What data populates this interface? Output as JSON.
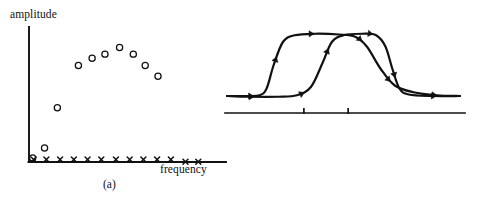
{
  "figure": {
    "width": 483,
    "height": 203,
    "background": "#ffffff",
    "ink_color": "#111111"
  },
  "panel_a": {
    "caption": "(a)",
    "y_axis_label": "amplitude",
    "x_axis_label": "frequency",
    "marker_styles": {
      "circle": "open-circle",
      "cross": "x-cross"
    }
  },
  "panel_b": {
    "caption": "(b)",
    "axis_ticks": 2
  },
  "chart_data": [
    {
      "id": "panel-a",
      "type": "scatter",
      "title": "(a)",
      "xlabel": "frequency",
      "ylabel": "amplitude",
      "xlim": [
        0,
        100
      ],
      "ylim": [
        0,
        100
      ],
      "grid": false,
      "legend": null,
      "axes": {
        "style": "two-spine",
        "ticks": false,
        "tick_labels": false,
        "x_arrow": false,
        "y_arrow": false
      },
      "series": [
        {
          "name": "circles",
          "marker": "open-circle",
          "marker_size": 6.2,
          "points": [
            {
              "x": 2.0,
              "y": 3.0
            },
            {
              "x": 8.5,
              "y": 10.5
            },
            {
              "x": 15.5,
              "y": 40.5
            },
            {
              "x": 27.0,
              "y": 72.0
            },
            {
              "x": 34.5,
              "y": 77.5
            },
            {
              "x": 41.5,
              "y": 80.5
            },
            {
              "x": 49.5,
              "y": 85.5
            },
            {
              "x": 57.0,
              "y": 80.5
            },
            {
              "x": 63.5,
              "y": 72.0
            },
            {
              "x": 70.5,
              "y": 64.0
            }
          ]
        },
        {
          "name": "crosses",
          "marker": "x-cross",
          "marker_size": 5.0,
          "points": [
            {
              "x": 2.5,
              "y": 1.8
            },
            {
              "x": 9.5,
              "y": 1.8
            },
            {
              "x": 17.0,
              "y": 1.8
            },
            {
              "x": 24.5,
              "y": 1.8
            },
            {
              "x": 32.0,
              "y": 1.8
            },
            {
              "x": 39.5,
              "y": 1.8
            },
            {
              "x": 47.5,
              "y": 1.8
            },
            {
              "x": 55.0,
              "y": 1.8
            },
            {
              "x": 62.5,
              "y": 1.8
            },
            {
              "x": 70.0,
              "y": 1.8
            },
            {
              "x": 77.5,
              "y": 1.8
            },
            {
              "x": 85.5,
              "y": 0.2
            },
            {
              "x": 92.5,
              "y": 0.2
            }
          ]
        }
      ]
    },
    {
      "id": "panel-b",
      "type": "line",
      "title": "(b)",
      "xlabel": "",
      "ylabel": "",
      "xlim": [
        0,
        100
      ],
      "ylim": [
        0,
        100
      ],
      "grid": false,
      "legend": null,
      "axes": {
        "style": "baseline-only",
        "ticks": true,
        "tick_positions": [
          33,
          52
        ],
        "tick_labels": false
      },
      "series": [
        {
          "name": "curve-left",
          "style": "plateau-with-direction-arrows",
          "arrow_markers": 6,
          "points": [
            {
              "x": 0,
              "y": 4
            },
            {
              "x": 8,
              "y": 4
            },
            {
              "x": 14,
              "y": 5
            },
            {
              "x": 17,
              "y": 14
            },
            {
              "x": 20,
              "y": 45
            },
            {
              "x": 24,
              "y": 76
            },
            {
              "x": 29,
              "y": 85
            },
            {
              "x": 38,
              "y": 87
            },
            {
              "x": 48,
              "y": 86
            },
            {
              "x": 55,
              "y": 83
            },
            {
              "x": 60,
              "y": 70
            },
            {
              "x": 66,
              "y": 40
            },
            {
              "x": 72,
              "y": 18
            },
            {
              "x": 80,
              "y": 9
            },
            {
              "x": 90,
              "y": 5
            },
            {
              "x": 100,
              "y": 4
            }
          ]
        },
        {
          "name": "curve-right",
          "style": "plateau-with-direction-arrows",
          "arrow_markers": 6,
          "points": [
            {
              "x": 0,
              "y": 4
            },
            {
              "x": 10,
              "y": 3
            },
            {
              "x": 22,
              "y": 3
            },
            {
              "x": 30,
              "y": 5
            },
            {
              "x": 36,
              "y": 16
            },
            {
              "x": 41,
              "y": 48
            },
            {
              "x": 45,
              "y": 76
            },
            {
              "x": 50,
              "y": 85
            },
            {
              "x": 58,
              "y": 87
            },
            {
              "x": 64,
              "y": 85
            },
            {
              "x": 68,
              "y": 70
            },
            {
              "x": 71,
              "y": 40
            },
            {
              "x": 74,
              "y": 14
            },
            {
              "x": 78,
              "y": 6
            },
            {
              "x": 88,
              "y": 4
            },
            {
              "x": 100,
              "y": 4
            }
          ]
        }
      ]
    }
  ]
}
